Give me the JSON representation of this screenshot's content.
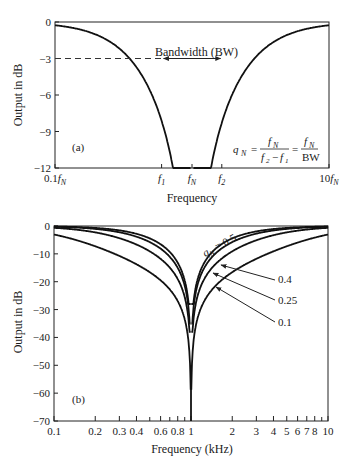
{
  "chart_data": [
    {
      "id": "a",
      "type": "line",
      "panel_label": "(a)",
      "title": "",
      "xlabel": "Frequency",
      "ylabel": "Output in dB",
      "xscale": "log",
      "x_tick_labels": [
        "0.1f_N",
        "f_1",
        "f_N",
        "f_2",
        "10f_N"
      ],
      "x_tick_values": [
        0.1,
        0.6,
        1,
        1.65,
        10
      ],
      "y_ticks": [
        0,
        -3,
        -6,
        -9,
        -12
      ],
      "ylim": [
        -12,
        0
      ],
      "xlim": [
        0.1,
        10
      ],
      "series": [
        {
          "name": "notch response",
          "q": 0.4
        }
      ],
      "annotations": {
        "bandwidth_label": "Bandwidth (BW)",
        "dashed_level_db": -3,
        "formula": "q_N = f_N / (f_2 - f_1) = f_N / BW"
      },
      "grid": false
    },
    {
      "id": "b",
      "type": "line",
      "panel_label": "(b)",
      "title": "",
      "xlabel": "Frequency (kHz)",
      "ylabel": "Output in dB",
      "xscale": "log",
      "x_ticks": [
        0.1,
        0.2,
        0.3,
        0.4,
        0.6,
        0.8,
        1,
        2,
        3,
        4,
        5,
        6,
        7,
        8,
        10
      ],
      "x_minor_ticks": [
        0.5,
        0.7,
        0.9,
        9
      ],
      "y_ticks": [
        0,
        -10,
        -20,
        -30,
        -40,
        -50,
        -60,
        -70
      ],
      "ylim": [
        -70,
        0
      ],
      "xlim": [
        0.1,
        10
      ],
      "series": [
        {
          "name": "q_N = 0.5",
          "q": 0.5,
          "min_db": -28
        },
        {
          "name": "0.4",
          "q": 0.4,
          "min_db": -35
        },
        {
          "name": "0.25",
          "q": 0.25,
          "min_db": -38
        },
        {
          "name": "0.1",
          "q": 0.1,
          "min_db": -70
        }
      ],
      "legend_labels": [
        "q_N = 0.5",
        "0.4",
        "0.25",
        "0.1"
      ],
      "grid": false
    }
  ]
}
